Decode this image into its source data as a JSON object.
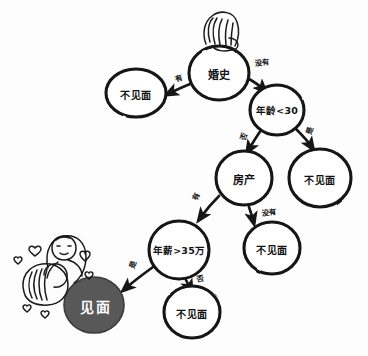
{
  "diagram": {
    "type": "flowchart",
    "style": "hand-drawn sketch",
    "colors": {
      "stroke": "#141414",
      "background": "#fdfdfd",
      "terminal_fill": "#595959",
      "terminal_text": "#ffffff"
    },
    "nodes": [
      {
        "id": "n1",
        "label": "婚史",
        "kind": "decision",
        "cx": 219,
        "cy": 73,
        "rx": 30,
        "ry": 27
      },
      {
        "id": "n2",
        "label": "不见面",
        "kind": "leaf",
        "cx": 136,
        "cy": 93,
        "rx": 30,
        "ry": 24
      },
      {
        "id": "n3",
        "label": "年龄<30",
        "kind": "decision",
        "cx": 277,
        "cy": 110,
        "rx": 27,
        "ry": 25
      },
      {
        "id": "n4",
        "label": "不见面",
        "kind": "leaf",
        "cx": 320,
        "cy": 178,
        "rx": 31,
        "ry": 29
      },
      {
        "id": "n5",
        "label": "房产",
        "kind": "decision",
        "cx": 244,
        "cy": 178,
        "rx": 28,
        "ry": 27
      },
      {
        "id": "n6",
        "label": "不见面",
        "kind": "leaf",
        "cx": 272,
        "cy": 248,
        "rx": 28,
        "ry": 26
      },
      {
        "id": "n7",
        "label": "年薪>35万",
        "kind": "decision",
        "cx": 179,
        "cy": 250,
        "rx": 30,
        "ry": 29
      },
      {
        "id": "n8",
        "label": "不见面",
        "kind": "leaf",
        "cx": 192,
        "cy": 312,
        "rx": 28,
        "ry": 26
      },
      {
        "id": "n9",
        "label": "见面",
        "kind": "terminal",
        "cx": 94,
        "cy": 305,
        "rx": 30,
        "ry": 28
      }
    ],
    "edges": [
      {
        "from": "n1",
        "to": "n2",
        "label": "有",
        "lx": 178,
        "ly": 78,
        "rot": -18
      },
      {
        "from": "n1",
        "to": "n3",
        "label": "没有",
        "lx": 262,
        "ly": 62,
        "rot": -5
      },
      {
        "from": "n3",
        "to": "n5",
        "label": "否",
        "lx": 243,
        "ly": 136,
        "rot": -72
      },
      {
        "from": "n3",
        "to": "n4",
        "label": "是",
        "lx": 309,
        "ly": 130,
        "rot": -72
      },
      {
        "from": "n5",
        "to": "n7",
        "label": "有",
        "lx": 195,
        "ly": 196,
        "rot": -68
      },
      {
        "from": "n5",
        "to": "n6",
        "label": "没有",
        "lx": 269,
        "ly": 212,
        "rot": -6
      },
      {
        "from": "n7",
        "to": "n9",
        "label": "是",
        "lx": 132,
        "ly": 264,
        "rot": -70
      },
      {
        "from": "n7",
        "to": "n8",
        "label": "否",
        "lx": 200,
        "ly": 278,
        "rot": -12
      }
    ],
    "illustrations": [
      {
        "name": "woman-head",
        "description": "sketched woman with long hair above root node"
      },
      {
        "name": "couple-hugging",
        "description": "sketched couple embracing with hearts beside the meet node"
      }
    ]
  }
}
